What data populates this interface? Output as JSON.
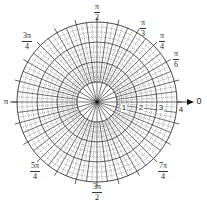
{
  "center": {
    "x": 97,
    "y": 102
  },
  "unit_radius_px": 20,
  "max_radius": 4,
  "colors": {
    "solid": "#333333",
    "dotted": "#555555",
    "background": "#ffffff"
  },
  "axis_label": "0",
  "pi_label": "π",
  "radius_labels": [
    {
      "text": "1",
      "x": 124,
      "y": 104
    },
    {
      "text": "2",
      "x": 141,
      "y": 104
    },
    {
      "text": "3",
      "x": 161,
      "y": 104
    },
    {
      "text": "4",
      "x": 181,
      "y": 106
    }
  ],
  "angle_labels": [
    {
      "num": "π",
      "den": "2",
      "x": 97,
      "y": 3
    },
    {
      "num": "π",
      "den": "3",
      "x": 143,
      "y": 19
    },
    {
      "num": "π",
      "den": "4",
      "x": 162,
      "y": 32
    },
    {
      "num": "π",
      "den": "6",
      "x": 176,
      "y": 50
    },
    {
      "num": "3π",
      "den": "4",
      "x": 27,
      "y": 32
    },
    {
      "num": "5π",
      "den": "4",
      "x": 35,
      "y": 162
    },
    {
      "num": "3π",
      "den": "2",
      "x": 97,
      "y": 183
    },
    {
      "num": "7π",
      "den": "4",
      "x": 163,
      "y": 162
    }
  ]
}
